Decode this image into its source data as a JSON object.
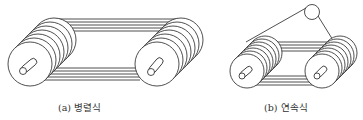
{
  "figure": {
    "panels": [
      {
        "id": "a",
        "caption": "(a) 병렬식",
        "type": "parallel",
        "pulleys": 2,
        "grooves_per_pulley": 7,
        "idler": false
      },
      {
        "id": "b",
        "caption": "(b) 연속식",
        "type": "continuous",
        "pulleys": 2,
        "grooves_per_pulley": 7,
        "idler": true
      }
    ]
  },
  "colors": {
    "line": "#222222",
    "background": "#ffffff"
  }
}
